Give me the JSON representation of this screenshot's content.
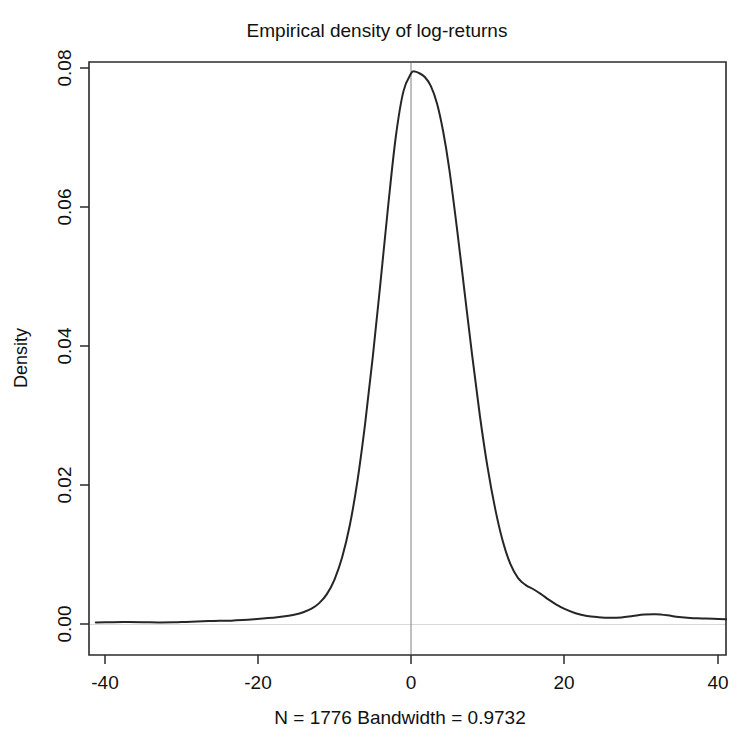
{
  "chart_data": {
    "type": "line",
    "title": "Empirical density of log-returns",
    "xlabel": "N = 1776  Bandwidth = 0.9732",
    "ylabel": "Density",
    "xlim": [
      -41.5,
      41.5
    ],
    "ylim": [
      -0.0016,
      0.0802
    ],
    "grid": false,
    "legend": null,
    "annotations": [
      {
        "name": "vertical-reference-line",
        "x": 0,
        "description": "vertical gray line at x = 0"
      }
    ],
    "x_ticks": [
      -40,
      -20,
      0,
      20,
      40
    ],
    "x_tick_labels": [
      "-40",
      "-20",
      "0",
      "20",
      "40"
    ],
    "y_ticks": [
      0.0,
      0.02,
      0.04,
      0.06,
      0.08
    ],
    "y_tick_labels": [
      "0.00",
      "0.02",
      "0.04",
      "0.06",
      "0.08"
    ],
    "series": [
      {
        "name": "Kernel density estimate of log-returns",
        "x": [
          -41.2,
          -39.0,
          -37.0,
          -35.0,
          -33.0,
          -31.0,
          -29.5,
          -28.0,
          -26.5,
          -25.0,
          -23.5,
          -22.0,
          -20.5,
          -19.0,
          -17.5,
          -16.0,
          -15.0,
          -14.0,
          -13.0,
          -12.0,
          -11.0,
          -10.0,
          -9.0,
          -8.0,
          -7.0,
          -6.0,
          -5.0,
          -4.0,
          -3.0,
          -2.0,
          -1.0,
          0.0,
          0.45,
          1.0,
          1.8,
          2.6,
          3.4,
          4.2,
          5.0,
          6.0,
          7.0,
          8.0,
          9.0,
          10.0,
          11.0,
          12.0,
          13.0,
          14.0,
          15.0,
          16.0,
          17.0,
          18.0,
          19.0,
          20.0,
          21.5,
          23.0,
          24.5,
          26.0,
          27.5,
          29.0,
          30.5,
          32.0,
          33.5,
          35.0,
          36.5,
          38.0,
          39.5,
          41.2
        ],
        "y": [
          0.00022,
          0.00026,
          0.00028,
          0.00026,
          0.00022,
          0.00024,
          0.0003,
          0.00036,
          0.00042,
          0.00046,
          0.00048,
          0.00056,
          0.00068,
          0.00082,
          0.00098,
          0.0012,
          0.0014,
          0.00172,
          0.0022,
          0.003,
          0.0043,
          0.0064,
          0.0096,
          0.0142,
          0.0206,
          0.0288,
          0.0384,
          0.049,
          0.06,
          0.07,
          0.0766,
          0.0792,
          0.0795,
          0.0793,
          0.0787,
          0.0774,
          0.0749,
          0.0709,
          0.0655,
          0.057,
          0.0478,
          0.0386,
          0.03,
          0.0226,
          0.0166,
          0.0119,
          0.0086,
          0.0066,
          0.0056,
          0.005,
          0.0043,
          0.0035,
          0.0028,
          0.0022,
          0.00155,
          0.00115,
          0.00098,
          0.0009,
          0.00095,
          0.00115,
          0.00135,
          0.0014,
          0.00125,
          0.001,
          0.00085,
          0.0008,
          0.00075,
          0.00068
        ]
      }
    ]
  },
  "plot": {
    "title": "Empirical density of log-returns",
    "subtitle": "N = 1776  Bandwidth = 0.9732",
    "y_axis_title": "Density",
    "colors": {
      "curve": "#262626",
      "axis": "#2b2b2b",
      "reference_line": "#8a8a8a",
      "background": "#ffffff"
    }
  }
}
